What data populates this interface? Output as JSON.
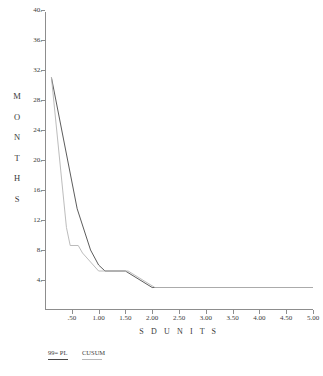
{
  "chart_data": {
    "type": "line",
    "title": "",
    "xlabel": "S D  U N I T S",
    "ylabel": "M O N T H S",
    "ylabel_letters": [
      "M",
      "O",
      "N",
      "T",
      "H",
      "S"
    ],
    "xlim": [
      0,
      5.0
    ],
    "ylim": [
      0,
      40
    ],
    "grid": false,
    "legend_position": "below-left",
    "x_ticks": [
      0.5,
      1.0,
      1.5,
      2.0,
      2.5,
      3.0,
      3.5,
      4.0,
      4.5,
      5.0
    ],
    "x_tick_labels": [
      ".50",
      "1.00",
      "1.50",
      "2.00",
      "2.50",
      "3.00",
      "3.50",
      "4.00",
      "4.50",
      "5.00"
    ],
    "y_ticks": [
      4,
      8,
      12,
      16,
      20,
      24,
      28,
      32,
      36,
      40
    ],
    "y_tick_labels": [
      "4.",
      "8.",
      "12.",
      "16.",
      "20.",
      "24.",
      "28.",
      "32.",
      "36.",
      "40."
    ],
    "series": [
      {
        "name": "99% PL",
        "color": "#4a4a4a",
        "points": [
          [
            0.12,
            31.0
          ],
          [
            0.6,
            13.5
          ],
          [
            0.85,
            8.0
          ],
          [
            1.0,
            6.0
          ],
          [
            1.12,
            5.2
          ],
          [
            1.5,
            5.2
          ],
          [
            2.0,
            3.0
          ],
          [
            5.0,
            3.0
          ]
        ]
      },
      {
        "name": "CUSUM",
        "color": "#b4b4b4",
        "points": [
          [
            0.12,
            31.0
          ],
          [
            0.4,
            11.0
          ],
          [
            0.47,
            8.6
          ],
          [
            0.62,
            8.6
          ],
          [
            0.7,
            7.6
          ],
          [
            1.0,
            5.2
          ],
          [
            1.12,
            5.2
          ],
          [
            1.55,
            5.2
          ],
          [
            2.05,
            3.0
          ],
          [
            5.0,
            3.0
          ]
        ]
      }
    ]
  },
  "legend": {
    "items": [
      {
        "label": "99= PL",
        "color": "#4a4a4a"
      },
      {
        "label": "CUSUM",
        "color": "#b9b9b9"
      }
    ]
  }
}
